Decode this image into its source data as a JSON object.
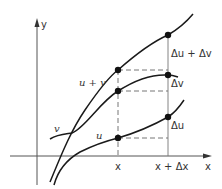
{
  "diagram": {
    "axes": {
      "x_label": "x",
      "y_label": "y"
    },
    "curves": [
      {
        "name": "u + v",
        "label": "u + v"
      },
      {
        "name": "v",
        "label": "v"
      },
      {
        "name": "u",
        "label": "u"
      }
    ],
    "ticks": {
      "x": "x",
      "x_plus_dx": "x + Δx"
    },
    "increments": {
      "du_plus_dv": "Δu + Δv",
      "dv": "Δv",
      "du": "Δu"
    },
    "colors": {
      "line": "#1a1a1a",
      "axis": "#555555",
      "dash": "#666666",
      "text": "#333333"
    }
  }
}
